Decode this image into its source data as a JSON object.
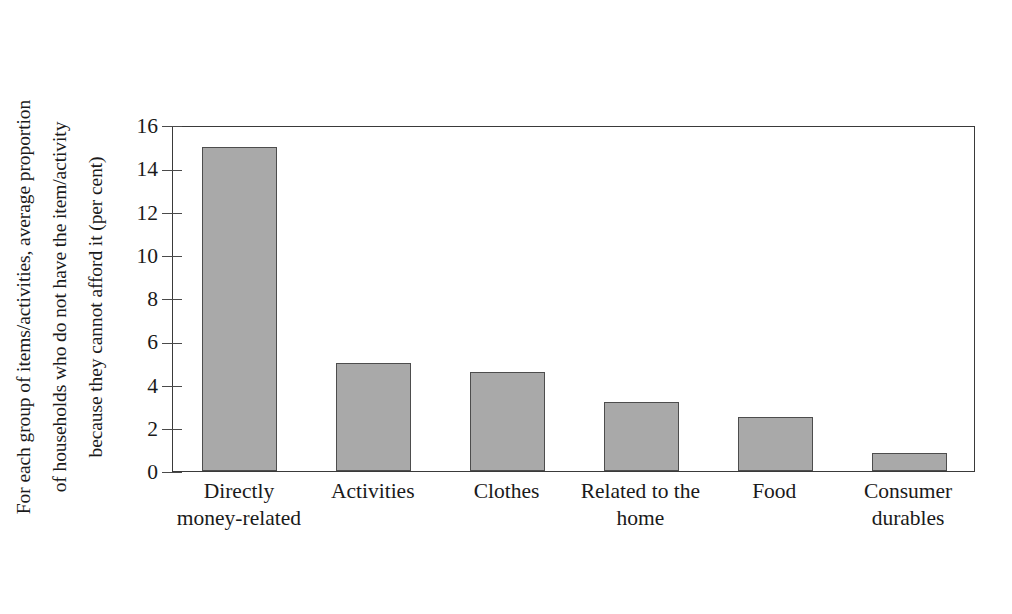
{
  "figure": {
    "background_color": "#ffffff",
    "bar_fill_color": "#a9a9a9",
    "bar_edge_color": "#4d4d4d",
    "axis_color": "#3a3a3a"
  },
  "chart_data": {
    "type": "bar",
    "title": "",
    "subtitle": "",
    "xlabel": "",
    "ylabel_lines": [
      "For each group of items/activities, average proportion",
      "of households who do not have the item/activity",
      "because they cannot afford it (per cent)"
    ],
    "ylabel": "For each group of items/activities, average proportion of households who do not have the item/activity because they cannot afford it (per cent)",
    "categories": [
      "Directly money-related",
      "Activities",
      "Clothes",
      "Related to the home",
      "Food",
      "Consumer durables"
    ],
    "category_label_lines": [
      [
        "Directly",
        "money-related"
      ],
      [
        "Activities"
      ],
      [
        "Clothes"
      ],
      [
        "Related to the",
        "home"
      ],
      [
        "Food"
      ],
      [
        "Consumer",
        "durables"
      ]
    ],
    "values": [
      15.0,
      5.0,
      4.6,
      3.2,
      2.5,
      0.85
    ],
    "ylim": [
      0,
      16
    ],
    "ytick_labels": [
      "0",
      "2",
      "4",
      "6",
      "8",
      "10",
      "12",
      "14",
      "16"
    ],
    "ytick_values": [
      0,
      2,
      4,
      6,
      8,
      10,
      12,
      14,
      16
    ],
    "grid": false,
    "legend": null,
    "legend_position": "none"
  }
}
